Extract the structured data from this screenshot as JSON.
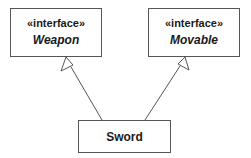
{
  "diagram": {
    "type": "uml-class",
    "classes": [
      {
        "id": "weapon",
        "stereotype": "«interface»",
        "name": "Weapon",
        "kind": "interface"
      },
      {
        "id": "movable",
        "stereotype": "«interface»",
        "name": "Movable",
        "kind": "interface"
      },
      {
        "id": "sword",
        "name": "Sword",
        "kind": "class"
      }
    ],
    "relations": [
      {
        "from": "sword",
        "to": "weapon",
        "type": "realization-arrow"
      },
      {
        "from": "sword",
        "to": "movable",
        "type": "realization-arrow"
      }
    ]
  }
}
